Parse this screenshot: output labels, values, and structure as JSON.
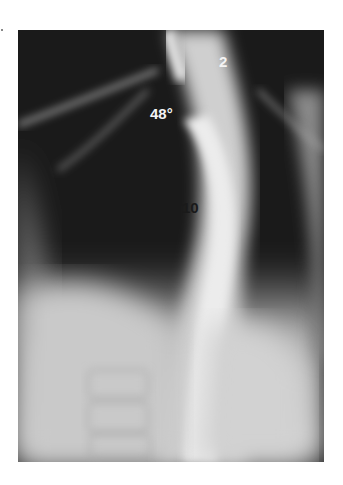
{
  "figure": {
    "type": "radiograph",
    "labels": [
      {
        "id": "vertebra-upper",
        "text": "2"
      },
      {
        "id": "cobb-angle",
        "text": "48°"
      },
      {
        "id": "vertebra-lower",
        "text": "10"
      }
    ]
  }
}
